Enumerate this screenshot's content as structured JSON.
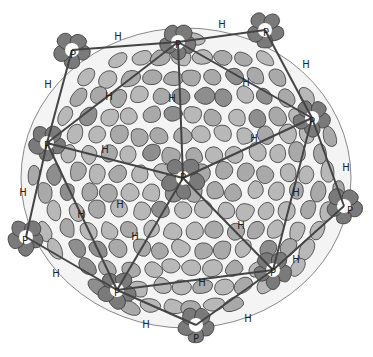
{
  "diagram": {
    "colors": {
      "background": "#ffffff",
      "hexon_light": "#b8b8b8",
      "hexon_mid": "#a9a9a9",
      "penton_dark": "#7a7a7a",
      "outline": "#3a3a3a",
      "edge_line": "#444444",
      "gap": "#f4f4f4"
    },
    "centers": [
      {
        "id": "p-center",
        "x": 183,
        "y": 178
      },
      {
        "id": "p-top",
        "x": 178,
        "y": 42
      },
      {
        "id": "p-left",
        "x": 47,
        "y": 143
      },
      {
        "id": "p-right",
        "x": 312,
        "y": 118
      },
      {
        "id": "p-bottom-left",
        "x": 117,
        "y": 290
      },
      {
        "id": "p-bottom-right",
        "x": 273,
        "y": 270
      },
      {
        "id": "p-outer-left",
        "x": 26,
        "y": 237
      },
      {
        "id": "p-outer-right",
        "x": 344,
        "y": 206
      },
      {
        "id": "p-outer-bottom",
        "x": 196,
        "y": 325
      },
      {
        "id": "p-outer-topleft",
        "x": 72,
        "y": 50
      },
      {
        "id": "p-outer-topright",
        "x": 265,
        "y": 30
      }
    ],
    "labels": [
      {
        "text": "P",
        "x": 178,
        "y": 45
      },
      {
        "text": "P",
        "x": 47,
        "y": 146
      },
      {
        "text": "P",
        "x": 183,
        "y": 178
      },
      {
        "text": "P",
        "x": 312,
        "y": 122
      },
      {
        "text": "P",
        "x": 117,
        "y": 293
      },
      {
        "text": "P",
        "x": 273,
        "y": 273
      },
      {
        "text": "P",
        "x": 25,
        "y": 241
      },
      {
        "text": "P",
        "x": 350,
        "y": 211
      },
      {
        "text": "P",
        "x": 196,
        "y": 339
      },
      {
        "text": "P",
        "x": 73,
        "y": 55
      },
      {
        "text": "P",
        "x": 266,
        "y": 33
      },
      {
        "text": "H",
        "x": 118,
        "y": 37
      },
      {
        "text": "H",
        "x": 222,
        "y": 25
      },
      {
        "text": "H",
        "x": 48,
        "y": 85
      },
      {
        "text": "H",
        "x": 109,
        "y": 97
      },
      {
        "text": "H",
        "x": 172,
        "y": 99
      },
      {
        "text": "H",
        "x": 246,
        "y": 83
      },
      {
        "text": "H",
        "x": 306,
        "y": 65
      },
      {
        "text": "H",
        "x": 105,
        "y": 150
      },
      {
        "text": "H",
        "x": 254,
        "y": 139
      },
      {
        "text": "H",
        "x": 346,
        "y": 168
      },
      {
        "text": "H",
        "x": 23,
        "y": 193
      },
      {
        "text": "H",
        "x": 81,
        "y": 215
      },
      {
        "text": "H",
        "x": 135,
        "y": 237
      },
      {
        "text": "H",
        "x": 241,
        "y": 226
      },
      {
        "text": "H",
        "x": 296,
        "y": 193
      },
      {
        "text": "H",
        "x": 56,
        "y": 274
      },
      {
        "text": "H",
        "x": 296,
        "y": 260
      },
      {
        "text": "H",
        "x": 202,
        "y": 283
      },
      {
        "text": "H",
        "x": 146,
        "y": 325
      },
      {
        "text": "H",
        "x": 248,
        "y": 319
      },
      {
        "text": "H",
        "x": 120,
        "y": 205
      }
    ],
    "edges": [
      [
        183,
        178,
        178,
        42
      ],
      [
        183,
        178,
        47,
        143
      ],
      [
        183,
        178,
        312,
        118
      ],
      [
        183,
        178,
        117,
        290
      ],
      [
        183,
        178,
        273,
        270
      ],
      [
        178,
        42,
        47,
        143
      ],
      [
        178,
        42,
        312,
        118
      ],
      [
        47,
        143,
        117,
        290
      ],
      [
        117,
        290,
        273,
        270
      ],
      [
        273,
        270,
        312,
        118
      ],
      [
        178,
        42,
        72,
        50
      ],
      [
        72,
        50,
        47,
        143
      ],
      [
        178,
        42,
        265,
        30
      ],
      [
        265,
        30,
        312,
        118
      ],
      [
        47,
        143,
        26,
        237
      ],
      [
        26,
        237,
        117,
        290
      ],
      [
        312,
        118,
        344,
        206
      ],
      [
        344,
        206,
        273,
        270
      ],
      [
        117,
        290,
        196,
        325
      ],
      [
        196,
        325,
        273,
        270
      ]
    ]
  }
}
